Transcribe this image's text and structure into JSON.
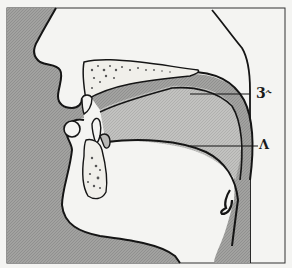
{
  "diagram": {
    "labels": [
      {
        "id": "r-colored-vowel",
        "text": "3˞"
      },
      {
        "id": "wedge-vowel",
        "text": "Λ"
      }
    ],
    "colors": {
      "background": "#f4f4f2",
      "tissue_dark": "#9a9a98",
      "tongue_mid": "#b4b4b2",
      "outline": "#151515",
      "bone_fill": "#f0efea"
    }
  }
}
